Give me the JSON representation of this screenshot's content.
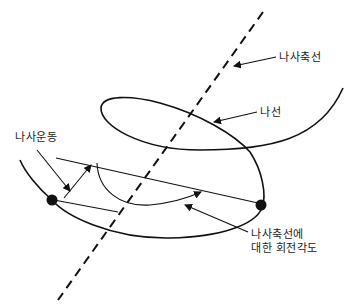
{
  "diagram": {
    "labels": {
      "screw_axis": "나사축선",
      "helix": "나선",
      "screw_motion": "나사운동",
      "rotation_angle_line1": "나사축선에",
      "rotation_angle_line2": "대한 회전각도"
    },
    "colors": {
      "stroke": "#111111",
      "background": "#ffffff"
    }
  }
}
